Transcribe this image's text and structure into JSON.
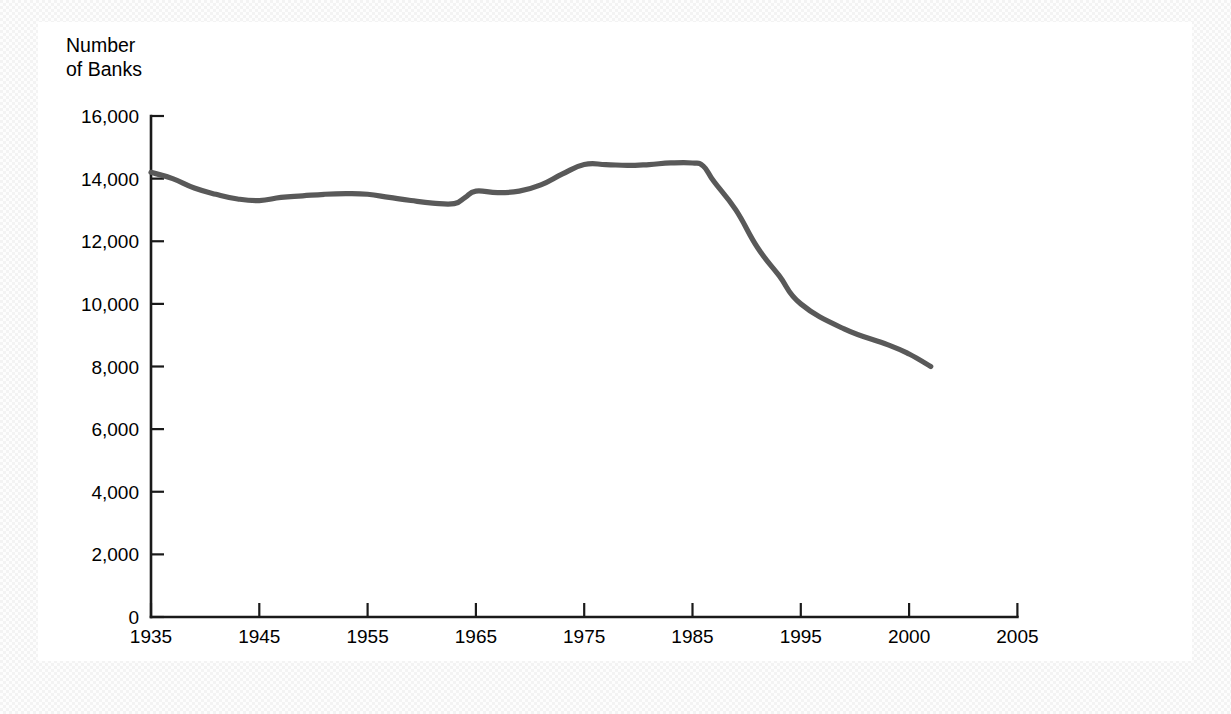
{
  "figure": {
    "background_color": "#ffffff",
    "page_color": "#f3f3f3"
  },
  "chart_data": {
    "type": "line",
    "title": "",
    "subtitle": "",
    "ylabel_line1": "Number",
    "ylabel_line2": "of Banks",
    "xlabel": "",
    "ylabel": "Number of Banks",
    "grid": false,
    "legend": null,
    "line_color": "#595959",
    "axis_color": "#1a1a1a",
    "ylim": [
      0,
      16000
    ],
    "yticks": [
      0,
      2000,
      4000,
      6000,
      8000,
      10000,
      12000,
      14000,
      16000
    ],
    "ytick_labels": [
      "0",
      "2,000",
      "4,000",
      "6,000",
      "8,000",
      "10,000",
      "12,000",
      "14,000",
      "16,000"
    ],
    "xticks": [
      1935,
      1945,
      1955,
      1965,
      1975,
      1985,
      1995,
      2000,
      2005
    ],
    "xtick_labels": [
      "1935",
      "1945",
      "1955",
      "1965",
      "1975",
      "1985",
      "1995",
      "2000",
      "2005"
    ],
    "xaxis_note": "tick marks equally spaced; last two intervals span 5 years each",
    "series": [
      {
        "name": "Number of Banks",
        "x": [
          1935,
          1937,
          1939,
          1941,
          1943,
          1945,
          1947,
          1949,
          1951,
          1953,
          1955,
          1957,
          1959,
          1961,
          1963,
          1964,
          1965,
          1967,
          1969,
          1971,
          1973,
          1975,
          1977,
          1979,
          1981,
          1983,
          1985,
          1986,
          1987,
          1989,
          1991,
          1993,
          1995,
          1997,
          1999,
          2000,
          2001
        ],
        "values": [
          14200,
          14000,
          13700,
          13500,
          13350,
          13300,
          13400,
          13450,
          13500,
          13520,
          13500,
          13400,
          13300,
          13220,
          13200,
          13400,
          13600,
          13550,
          13600,
          13800,
          14150,
          14450,
          14450,
          14420,
          14450,
          14500,
          14500,
          14400,
          13900,
          13000,
          11800,
          10900,
          10000,
          9200,
          8700,
          8400,
          8000
        ]
      }
    ]
  }
}
